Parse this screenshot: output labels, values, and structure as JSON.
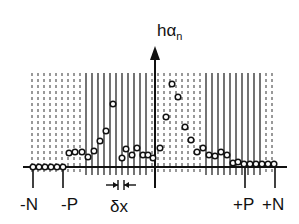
{
  "diagram": {
    "y_axis_label": "hα",
    "y_axis_label_sub": "n",
    "x_labels": [
      {
        "text": "-N",
        "x": 32
      },
      {
        "text": "-P",
        "x": 72
      },
      {
        "text": "δx",
        "x": 120
      },
      {
        "text": "+P",
        "x": 246
      },
      {
        "text": "+N",
        "x": 277
      }
    ],
    "samples": [
      [
        33,
        167
      ],
      [
        39,
        167
      ],
      [
        45,
        167
      ],
      [
        51,
        167
      ],
      [
        57,
        167
      ],
      [
        63,
        167
      ],
      [
        69,
        153
      ],
      [
        75,
        152
      ],
      [
        82,
        152
      ],
      [
        88,
        157
      ],
      [
        94,
        151
      ],
      [
        100,
        141
      ],
      [
        106,
        131
      ],
      [
        113,
        104
      ],
      [
        122,
        158
      ],
      [
        126,
        149
      ],
      [
        132,
        155
      ],
      [
        137,
        148
      ],
      [
        143,
        155
      ],
      [
        148,
        155
      ],
      [
        153,
        158
      ],
      [
        160,
        148
      ],
      [
        166,
        117
      ],
      [
        172,
        84
      ],
      [
        178,
        97
      ],
      [
        185,
        127
      ],
      [
        191,
        140
      ],
      [
        197,
        152
      ],
      [
        203,
        148
      ],
      [
        209,
        155
      ],
      [
        215,
        156
      ],
      [
        221,
        152
      ],
      [
        227,
        155
      ],
      [
        233,
        163
      ],
      [
        238,
        162
      ],
      [
        244,
        164
      ],
      [
        250,
        164
      ],
      [
        256,
        164
      ],
      [
        262,
        164
      ],
      [
        268,
        164
      ],
      [
        274,
        164
      ]
    ],
    "colors": {
      "ink": "#111111",
      "hatch": "#333333",
      "background": "#ffffff"
    }
  }
}
